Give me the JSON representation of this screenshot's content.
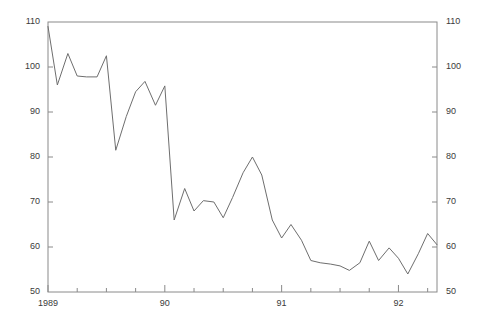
{
  "chart_data": {
    "type": "line",
    "title": "",
    "subtitle": "",
    "xlabel": "",
    "ylabel": "",
    "grid": false,
    "legend": "none",
    "line_color": "#6e6e6e",
    "background_color": "#ffffff",
    "axis_color": "#8a8a8a",
    "ylim": [
      50,
      110
    ],
    "y_ticks": [
      50,
      60,
      70,
      80,
      90,
      100,
      110
    ],
    "y_tick_labels": [
      "50",
      "60",
      "70",
      "80",
      "90",
      "100",
      "110"
    ],
    "y_axis_labels_both_sides": true,
    "xlim": [
      1989.0,
      1992.33
    ],
    "x_tick_labels": [
      "1989",
      "90",
      "91",
      "92"
    ],
    "x_tick_values": [
      1989,
      1990,
      1991,
      1992
    ],
    "x_minor_ticks_per_year": 4,
    "x_minor_tick_interval": "quarterly",
    "data_frequency": "monthly",
    "series": [
      {
        "name": "series-1",
        "x": [
          1989.0,
          1989.08,
          1989.17,
          1989.25,
          1989.33,
          1989.42,
          1989.5,
          1989.58,
          1989.67,
          1989.75,
          1989.83,
          1989.92,
          1990.0,
          1990.08,
          1990.17,
          1990.25,
          1990.33,
          1990.42,
          1990.5,
          1990.58,
          1990.67,
          1990.75,
          1990.83,
          1990.92,
          1991.0,
          1991.08,
          1991.17,
          1991.25,
          1991.33,
          1991.42,
          1991.5,
          1991.58,
          1991.67,
          1991.75,
          1991.83,
          1991.92,
          1992.0,
          1992.08,
          1992.17,
          1992.25,
          1992.33
        ],
        "values": [
          109.0,
          96.0,
          103.0,
          98.0,
          97.8,
          97.8,
          102.5,
          81.5,
          89.0,
          94.5,
          96.8,
          91.5,
          95.8,
          66.0,
          73.0,
          68.0,
          70.3,
          70.0,
          66.5,
          71.0,
          76.5,
          80.0,
          76.0,
          66.0,
          62.0,
          65.0,
          61.5,
          57.0,
          56.5,
          56.2,
          55.8,
          54.8,
          56.5,
          61.3,
          57.0,
          59.8,
          57.5,
          54.0,
          58.5,
          63.0,
          60.5
        ]
      }
    ]
  },
  "plot_geometry": {
    "left": 48,
    "right": 437,
    "top": 22,
    "bottom": 292
  }
}
